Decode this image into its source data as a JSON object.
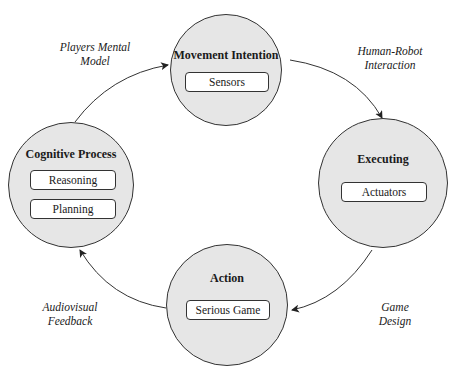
{
  "nodes": {
    "top": {
      "title": "Movement Intention",
      "items": [
        "Sensors"
      ]
    },
    "right": {
      "title": "Executing",
      "items": [
        "Actuators"
      ]
    },
    "bottom": {
      "title": "Action",
      "items": [
        "Serious Game"
      ]
    },
    "left": {
      "title": "Cognitive Process",
      "items": [
        "Reasoning",
        "Planning"
      ]
    }
  },
  "edges": {
    "top_left": [
      "Players Mental",
      "Model"
    ],
    "top_right": [
      "Human-Robot",
      "Interaction"
    ],
    "bottom_right": [
      "Game",
      "Design"
    ],
    "bottom_left": [
      "Audiovisual",
      "Feedback"
    ]
  },
  "colors": {
    "node_fill": "#e6e6e6",
    "stroke": "#333333"
  }
}
